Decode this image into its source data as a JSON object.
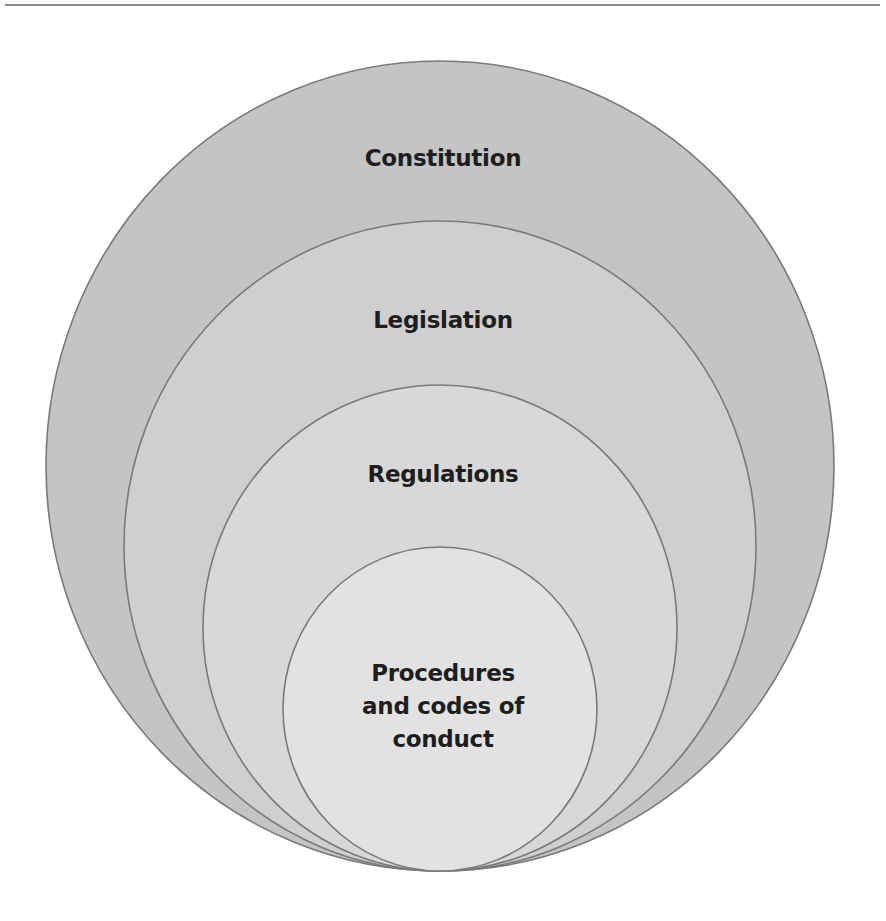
{
  "diagram": {
    "type": "nested-circles",
    "colors": {
      "background": "#ffffff",
      "stroke": "#7a7a7a",
      "rule": "#8a8a8a",
      "text": "#1e1e1e"
    },
    "levels": [
      {
        "label": "Constitution",
        "fill": "#c4c4c4"
      },
      {
        "label": "Legislation",
        "fill": "#cfcfcf"
      },
      {
        "label": "Regulations",
        "fill": "#d8d8d8"
      },
      {
        "label_lines": [
          "Procedures",
          "and codes of",
          "conduct"
        ],
        "fill": "#e2e2e2"
      }
    ]
  }
}
